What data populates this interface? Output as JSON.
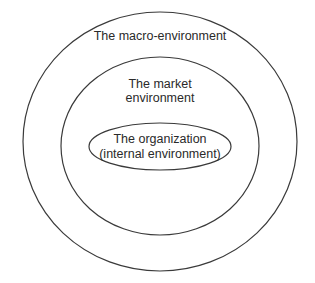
{
  "diagram": {
    "type": "nested-environment-layers",
    "layers": [
      {
        "id": "macro",
        "shape": "circle",
        "label_lines": [
          "The macro-environment"
        ]
      },
      {
        "id": "market",
        "shape": "circle",
        "label_lines": [
          "The market",
          "environment"
        ]
      },
      {
        "id": "organization",
        "shape": "ellipse",
        "label_lines": [
          "The organization",
          "(internal environment)"
        ]
      }
    ],
    "colors": {
      "stroke": "#3a3a3a",
      "text": "#2a2a2a",
      "background": "#ffffff"
    }
  }
}
